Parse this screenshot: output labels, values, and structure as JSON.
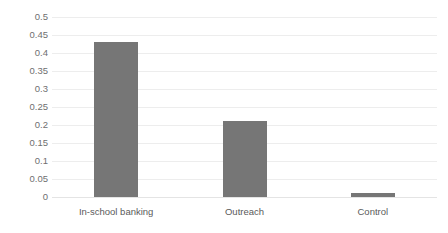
{
  "chart_data": {
    "type": "bar",
    "title": "",
    "subtitle": "",
    "xlabel": "",
    "ylabel": "",
    "categories": [
      "In-school banking",
      "Outreach",
      "Control"
    ],
    "values": [
      0.43,
      0.21,
      0.01
    ],
    "series": [
      {
        "name": "",
        "values": [
          0.43,
          0.21,
          0.01
        ]
      }
    ],
    "ylim": [
      0,
      0.5
    ],
    "ytick_labels": [
      "0.5",
      "0.45",
      "0.4",
      "0.35",
      "0.3",
      "0.25",
      "0.2",
      "0.15",
      "0.1",
      "0.05",
      "0"
    ],
    "ytick_values": [
      0.5,
      0.45,
      0.4,
      0.35,
      0.3,
      0.25,
      0.2,
      0.15,
      0.1,
      0.05,
      0
    ],
    "grid": true,
    "grid_axis": "y",
    "legend": false,
    "legend_position": "none",
    "annotations": [],
    "colors": {
      "bar": "#767676",
      "gridline": "#ededed",
      "baseline": "#e4e4e4",
      "tick_label": "#6f6f6f",
      "category_label": "#5a5a5a",
      "background": "#ffffff"
    }
  }
}
